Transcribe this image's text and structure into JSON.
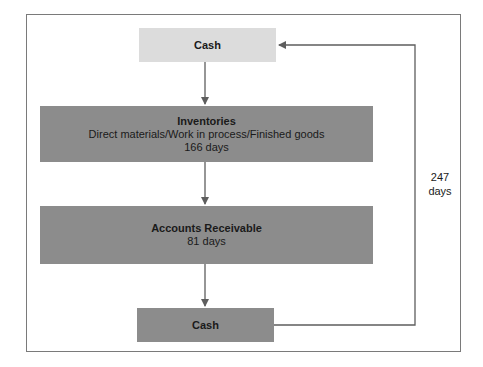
{
  "diagram": {
    "type": "cash-conversion-cycle-flow",
    "colors": {
      "border": "#7a7a7a",
      "light_box": "#dcdcdc",
      "dark_box": "#8c8c8c",
      "connector": "#5e5e5e",
      "text": "#1a1a1a"
    },
    "nodes": [
      {
        "id": "cash_start",
        "title": "Cash",
        "lines": []
      },
      {
        "id": "inventories",
        "title": "Inventories",
        "lines": [
          "Direct materials/Work in process/Finished goods",
          "166 days"
        ]
      },
      {
        "id": "receivables",
        "title": "Accounts Receivable",
        "lines": [
          "81 days"
        ]
      },
      {
        "id": "cash_end",
        "title": "Cash",
        "lines": []
      }
    ],
    "edges": [
      {
        "from": "cash_start",
        "to": "inventories"
      },
      {
        "from": "inventories",
        "to": "receivables"
      },
      {
        "from": "receivables",
        "to": "cash_end"
      },
      {
        "from": "cash_end",
        "to": "cash_start",
        "label": "247 days"
      }
    ],
    "cycle_label": {
      "value": "247",
      "unit": "days"
    }
  }
}
